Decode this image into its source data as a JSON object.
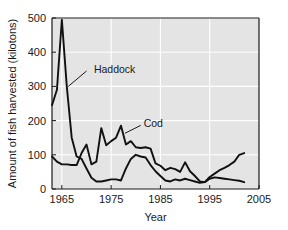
{
  "chart_data": {
    "type": "line",
    "title": "",
    "subtitle": "",
    "xlabel": "Year",
    "ylabel": "Amount of fish harvested (kilotons)",
    "xlim": [
      1963,
      2005
    ],
    "ylim": [
      0,
      500
    ],
    "xticks": [
      1965,
      1975,
      1985,
      1995,
      2005
    ],
    "yticks": [
      0,
      100,
      200,
      300,
      400,
      500
    ],
    "xtick_labels": [
      "1965",
      "1975",
      "1985",
      "1995",
      "2005"
    ],
    "ytick_labels": [
      "0",
      "100",
      "200",
      "300",
      "400",
      "500"
    ],
    "grid": true,
    "grid_color": "#ffffff",
    "plot_background": "#e4e4e4",
    "legend_position": "inline-annotations",
    "series": [
      {
        "name": "Haddock",
        "color": "#111111",
        "annotation_label": "Haddock",
        "x": [
          1963,
          1964,
          1965,
          1966,
          1967,
          1968,
          1969,
          1970,
          1971,
          1972,
          1973,
          1974,
          1975,
          1976,
          1977,
          1978,
          1979,
          1980,
          1981,
          1982,
          1983,
          1984,
          1985,
          1986,
          1987,
          1988,
          1989,
          1990,
          1991,
          1992,
          1993,
          1994,
          1995,
          1996,
          1997,
          1998,
          1999,
          2000,
          2001,
          2002
        ],
        "values": [
          245,
          290,
          495,
          300,
          150,
          95,
          88,
          60,
          33,
          22,
          22,
          25,
          28,
          28,
          25,
          60,
          88,
          100,
          95,
          92,
          70,
          52,
          38,
          25,
          22,
          28,
          25,
          30,
          26,
          22,
          18,
          20,
          30,
          34,
          32,
          30,
          28,
          26,
          24,
          20
        ]
      },
      {
        "name": "Cod",
        "color": "#111111",
        "annotation_label": "Cod",
        "x": [
          1963,
          1964,
          1965,
          1966,
          1967,
          1968,
          1969,
          1970,
          1971,
          1972,
          1973,
          1974,
          1975,
          1976,
          1977,
          1978,
          1979,
          1980,
          1981,
          1982,
          1983,
          1984,
          1985,
          1986,
          1987,
          1988,
          1989,
          1990,
          1991,
          1992,
          1993,
          1994,
          1995,
          1996,
          1997,
          1998,
          1999,
          2000,
          2001,
          2002
        ],
        "values": [
          95,
          80,
          72,
          72,
          70,
          70,
          105,
          130,
          72,
          80,
          178,
          128,
          140,
          150,
          185,
          130,
          140,
          122,
          120,
          122,
          118,
          75,
          68,
          55,
          62,
          58,
          50,
          78,
          52,
          38,
          22,
          20,
          35,
          45,
          55,
          62,
          70,
          80,
          100,
          105
        ]
      }
    ],
    "annotations": [
      {
        "label": "Haddock",
        "text_x": 1971.5,
        "text_y": 352,
        "leader_from_x": 1970.0,
        "leader_from_y": 345,
        "leader_to_x": 1966.3,
        "leader_to_y": 300
      },
      {
        "label": "Cod",
        "text_x": 1981.6,
        "text_y": 192,
        "leader_from_x": 1981.0,
        "leader_from_y": 186,
        "leader_to_x": 1977.8,
        "leader_to_y": 163
      }
    ]
  }
}
